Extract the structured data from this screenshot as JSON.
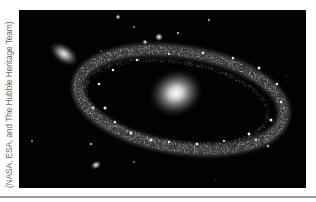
{
  "figure": {
    "credit": "(NASA, ESA, and The Hubble Heritage Team)",
    "background_color": "#020202",
    "elements": {
      "ring_galaxy": {
        "label": "ring galaxy with bright core"
      },
      "companion_galaxy": {
        "label": "elliptical companion galaxy"
      },
      "small_galaxy": {
        "label": "small distant galaxy"
      },
      "stars": {
        "label": "foreground stars"
      }
    }
  }
}
